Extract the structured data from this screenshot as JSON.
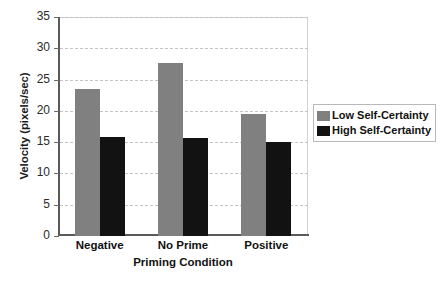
{
  "chart_data": {
    "type": "bar",
    "title": "",
    "xlabel": "Priming Condition",
    "ylabel": "Velocity (pixels/sec)",
    "categories": [
      "Negative",
      "No Prime",
      "Positive"
    ],
    "series": [
      {
        "name": "Low Self-Certainty",
        "color": "#808080",
        "values": [
          23.5,
          27.6,
          19.5
        ]
      },
      {
        "name": "High Self-Certainty",
        "color": "#121212",
        "values": [
          15.8,
          15.7,
          15.1
        ]
      }
    ],
    "ylim": [
      0,
      35
    ],
    "yticks": [
      0,
      5,
      10,
      15,
      20,
      25,
      30,
      35
    ],
    "ytick_labels": [
      "0",
      "5",
      "10",
      "15",
      "20",
      "25",
      "30",
      "35"
    ],
    "grid": "horizontal-dashed",
    "legend_position": "right"
  },
  "legend": {
    "entries": [
      {
        "label": "Low Self-Certainty",
        "swatch": "low-self-certainty-swatch"
      },
      {
        "label": "High Self-Certainty",
        "swatch": "high-self-certainty-swatch"
      }
    ]
  },
  "caption": {
    "partial_text": ""
  }
}
